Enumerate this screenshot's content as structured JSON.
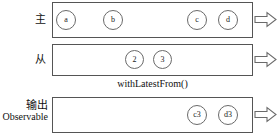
{
  "diagram": {
    "operator_caption": "withLatestFrom()",
    "colors": {
      "box_border": "#555555",
      "marble_border": "#6a6a6a",
      "text": "#111111",
      "background": "#ffffff"
    },
    "rows": [
      {
        "id": "primary",
        "label_cjk": "主",
        "label_latin": "",
        "marbles": [
          {
            "text": "a",
            "x": 56,
            "y": 10
          },
          {
            "text": "b",
            "x": 103,
            "y": 10
          },
          {
            "text": "c",
            "x": 187,
            "y": 10
          },
          {
            "text": "d",
            "x": 218,
            "y": 10
          }
        ],
        "arrow": "arrow-right-outline"
      },
      {
        "id": "secondary",
        "label_cjk": "从",
        "label_latin": "",
        "marbles": [
          {
            "text": "2",
            "x": 125,
            "y": 50
          },
          {
            "text": "3",
            "x": 153,
            "y": 50
          }
        ],
        "arrow": "arrow-right-outline"
      },
      {
        "id": "output",
        "label_cjk": "输出",
        "label_latin": "Observable",
        "marbles": [
          {
            "text": "c3",
            "x": 187,
            "y": 105
          },
          {
            "text": "d3",
            "x": 218,
            "y": 105
          }
        ],
        "arrow": "arrow-right-outline"
      }
    ]
  }
}
